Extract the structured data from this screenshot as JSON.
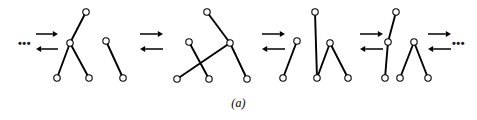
{
  "figure": {
    "caption": "(a)",
    "ellipsis_left": "•••",
    "ellipsis_right": "•••",
    "stroke_color": "#000000",
    "node_fill": "#ffffff",
    "background": "#ffffff",
    "node_radius": 3.2,
    "edge_width": 1.9,
    "node_stroke_width": 1.1
  },
  "chart_data": {
    "type": "diagram",
    "title": "(a)",
    "xlim": [
      0,
      477
    ],
    "ylim": [
      0,
      120
    ],
    "grid": false,
    "legend": null,
    "states": [
      {
        "name": "state-1",
        "nodes": [
          {
            "id": "s1n1",
            "x": 86,
            "y": 12
          },
          {
            "id": "s1n2",
            "x": 70,
            "y": 43
          },
          {
            "id": "s1n3",
            "x": 57,
            "y": 78
          },
          {
            "id": "s1n4",
            "x": 89,
            "y": 78
          },
          {
            "id": "s1n5",
            "x": 106,
            "y": 41
          },
          {
            "id": "s1n6",
            "x": 123,
            "y": 78
          }
        ],
        "edges": [
          {
            "from": "s1n1",
            "to": "s1n2"
          },
          {
            "from": "s1n2",
            "to": "s1n3"
          },
          {
            "from": "s1n2",
            "to": "s1n4"
          },
          {
            "from": "s1n5",
            "to": "s1n6"
          }
        ]
      },
      {
        "name": "state-2",
        "nodes": [
          {
            "id": "s2n1",
            "x": 207,
            "y": 12
          },
          {
            "id": "s2n2",
            "x": 230,
            "y": 43
          },
          {
            "id": "s2n3",
            "x": 189,
            "y": 42
          },
          {
            "id": "s2n4",
            "x": 209,
            "y": 79
          },
          {
            "id": "s2n5",
            "x": 177,
            "y": 79
          },
          {
            "id": "s2n6",
            "x": 247,
            "y": 79
          }
        ],
        "edges": [
          {
            "from": "s2n1",
            "to": "s2n2"
          },
          {
            "from": "s2n2",
            "to": "s2n6"
          },
          {
            "from": "s2n2",
            "to": "s2n5"
          },
          {
            "from": "s2n3",
            "to": "s2n4"
          }
        ]
      },
      {
        "name": "state-3",
        "nodes": [
          {
            "id": "s3n1",
            "x": 297,
            "y": 41
          },
          {
            "id": "s3n2",
            "x": 283,
            "y": 78
          },
          {
            "id": "s3n3",
            "x": 315,
            "y": 12
          },
          {
            "id": "s3n4",
            "x": 317,
            "y": 78
          },
          {
            "id": "s3n5",
            "x": 330,
            "y": 43
          },
          {
            "id": "s3n6",
            "x": 348,
            "y": 78
          }
        ],
        "edges": [
          {
            "from": "s3n1",
            "to": "s3n2"
          },
          {
            "from": "s3n3",
            "to": "s3n4"
          },
          {
            "from": "s3n4",
            "to": "s3n5"
          },
          {
            "from": "s3n5",
            "to": "s3n6"
          }
        ]
      },
      {
        "name": "state-4",
        "nodes": [
          {
            "id": "s4n1",
            "x": 396,
            "y": 12
          },
          {
            "id": "s4n2",
            "x": 388,
            "y": 42
          },
          {
            "id": "s4n3",
            "x": 385,
            "y": 78
          },
          {
            "id": "s4n4",
            "x": 400,
            "y": 78
          },
          {
            "id": "s4n5",
            "x": 414,
            "y": 42
          },
          {
            "id": "s4n6",
            "x": 428,
            "y": 78
          }
        ],
        "edges": [
          {
            "from": "s4n1",
            "to": "s4n2"
          },
          {
            "from": "s4n2",
            "to": "s4n3"
          },
          {
            "from": "s4n4",
            "to": "s4n5"
          },
          {
            "from": "s4n5",
            "to": "s4n6"
          }
        ]
      }
    ],
    "arrow_pairs": [
      {
        "name": "arrows-0",
        "x1": 36,
        "x2": 58,
        "y_top": 34,
        "y_bottom": 49,
        "top_dir": "right",
        "bottom_dir": "left"
      },
      {
        "name": "arrows-1",
        "x1": 140,
        "x2": 163,
        "y_top": 34,
        "y_bottom": 49,
        "top_dir": "right",
        "bottom_dir": "left"
      },
      {
        "name": "arrows-2",
        "x1": 262,
        "x2": 285,
        "y_top": 34,
        "y_bottom": 49,
        "top_dir": "right",
        "bottom_dir": "left"
      },
      {
        "name": "arrows-3",
        "x1": 360,
        "x2": 383,
        "y_top": 34,
        "y_bottom": 49,
        "top_dir": "right",
        "bottom_dir": "left"
      },
      {
        "name": "arrows-4",
        "x1": 428,
        "x2": 451,
        "y_top": 34,
        "y_bottom": 49,
        "top_dir": "right",
        "bottom_dir": "left"
      }
    ]
  }
}
